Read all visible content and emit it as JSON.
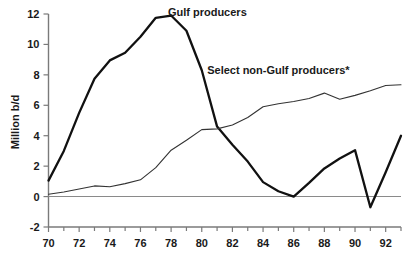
{
  "chart_data": {
    "type": "line",
    "title": "",
    "xlabel": "",
    "ylabel": "Million b/d",
    "xlim": [
      70,
      93
    ],
    "ylim": [
      -2,
      12
    ],
    "grid": false,
    "legend_position": "inline-annotations",
    "x_tick_labels": [
      "70",
      "72",
      "74",
      "76",
      "78",
      "80",
      "82",
      "84",
      "86",
      "88",
      "90",
      "92"
    ],
    "x_tick_values": [
      70,
      72,
      74,
      76,
      78,
      80,
      82,
      84,
      86,
      88,
      90,
      92
    ],
    "x_minor_tick_values": [
      71,
      73,
      75,
      77,
      79,
      81,
      83,
      85,
      87,
      89,
      91,
      93
    ],
    "y_tick_labels": [
      "12",
      "10",
      "8",
      "6",
      "4",
      "2",
      "0",
      "-2"
    ],
    "y_tick_values": [
      12,
      10,
      8,
      6,
      4,
      2,
      0,
      -2
    ],
    "zero_reference_line": 0,
    "x": [
      70,
      71,
      72,
      73,
      74,
      75,
      76,
      77,
      78,
      79,
      80,
      81,
      82,
      83,
      84,
      85,
      86,
      87,
      88,
      89,
      90,
      91,
      92,
      93
    ],
    "series": [
      {
        "name": "Gulf producers",
        "label": "Gulf producers",
        "label_x": 77.4,
        "label_y": 11.85,
        "stroke": "#111111",
        "stroke_width": 2.3,
        "values": [
          1.05,
          3.0,
          5.5,
          7.75,
          8.95,
          9.45,
          10.5,
          11.75,
          11.9,
          10.9,
          8.3,
          4.6,
          3.4,
          2.3,
          0.95,
          0.35,
          0.0,
          0.9,
          1.85,
          2.5,
          3.05,
          -0.7,
          1.6,
          4.0
        ]
      },
      {
        "name": "Select non-Gulf producers*",
        "label": "Select non-Gulf producers*",
        "label_x": 85.0,
        "label_y": 8.05,
        "stroke": "#333333",
        "stroke_width": 1.1,
        "values": [
          0.15,
          0.3,
          0.5,
          0.7,
          0.65,
          0.85,
          1.1,
          1.9,
          3.05,
          3.7,
          4.4,
          4.45,
          4.7,
          5.2,
          5.9,
          6.1,
          6.25,
          6.45,
          6.8,
          6.4,
          6.65,
          6.95,
          7.3,
          7.35
        ]
      }
    ]
  }
}
